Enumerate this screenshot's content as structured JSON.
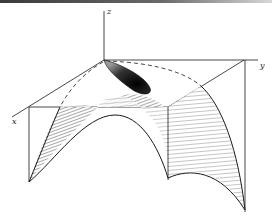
{
  "figure": {
    "type": "3d-surface-diagram",
    "axes": {
      "x": {
        "label": "x"
      },
      "y": {
        "label": "y"
      },
      "z": {
        "label": "z"
      }
    },
    "colors": {
      "ink": "#1a1a1a",
      "shade": "#555555",
      "paper": "#ffffff"
    }
  }
}
